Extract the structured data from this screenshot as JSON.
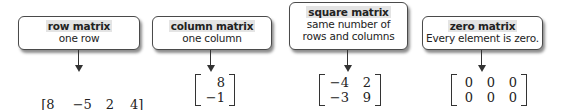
{
  "diagram": {
    "items": [
      {
        "title": "row matrix",
        "description": [
          "one row"
        ],
        "matrix": [
          [
            "8",
            "−5",
            "2",
            "4"
          ]
        ]
      },
      {
        "title": "column matrix",
        "description": [
          "one column"
        ],
        "matrix": [
          [
            "8"
          ],
          [
            "−1"
          ]
        ]
      },
      {
        "title": "square matrix",
        "description": [
          "same number of",
          "rows and columns"
        ],
        "matrix": [
          [
            "−4",
            "2"
          ],
          [
            "−3",
            "9"
          ]
        ]
      },
      {
        "title": "zero matrix",
        "description": [
          "Every element is zero."
        ],
        "matrix": [
          [
            "0",
            "0",
            "0"
          ],
          [
            "0",
            "0",
            "0"
          ]
        ]
      }
    ]
  }
}
